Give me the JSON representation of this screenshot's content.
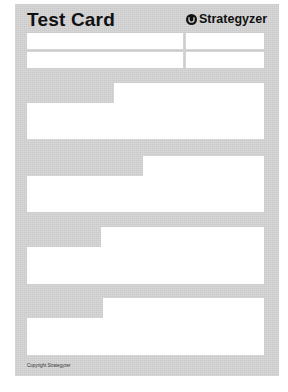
{
  "card": {
    "title": "Test Card",
    "brand": {
      "icon": "strategyzer-logo-icon",
      "name": "Strategyzer"
    },
    "header_fields": [
      {
        "row": 1,
        "left": "",
        "right": ""
      },
      {
        "row": 2,
        "left": "",
        "right": ""
      }
    ],
    "sections": [
      {
        "index": 1,
        "content": ""
      },
      {
        "index": 2,
        "content": ""
      },
      {
        "index": 3,
        "content": ""
      },
      {
        "index": 4,
        "content": ""
      }
    ],
    "footer": {
      "copyright": "Copyright Strategyzer"
    }
  },
  "colors": {
    "card_background": "#c9c9c9",
    "field_background": "#ffffff",
    "text": "#111111"
  }
}
